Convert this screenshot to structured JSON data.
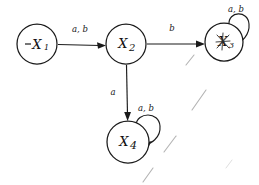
{
  "diagram": {
    "kind": "state-transition-diagram",
    "alphabet": [
      "a",
      "b"
    ],
    "ink_color": "#1a1a1a",
    "background_color": "#ffffff"
  },
  "states": [
    {
      "id": "x1",
      "label": "X",
      "subscript": "1",
      "initial_marker": "–",
      "is_initial": true,
      "cx": 37,
      "cy": 44,
      "r": 20
    },
    {
      "id": "x2",
      "label": "X",
      "subscript": "2",
      "is_initial": false,
      "cx": 126,
      "cy": 44,
      "r": 20
    },
    {
      "id": "x3",
      "label": "X",
      "subscript": "3",
      "overwritten": true,
      "is_initial": false,
      "cx": 224,
      "cy": 42,
      "r": 19
    },
    {
      "id": "x4",
      "label": "X",
      "subscript": "4",
      "is_initial": false,
      "cx": 128,
      "cy": 142,
      "r": 21
    }
  ],
  "transitions": [
    {
      "from": "x1",
      "to": "x2",
      "label": "a, b",
      "label_x": 80,
      "label_y": 29
    },
    {
      "from": "x2",
      "to": "x3",
      "label": "b",
      "label_x": 172,
      "label_y": 28
    },
    {
      "from": "x2",
      "to": "x4",
      "label": "a",
      "label_x": 113,
      "label_y": 92
    }
  ],
  "self_loops": [
    {
      "state": "x3",
      "label": "a, b",
      "label_x": 236,
      "label_y": 9
    },
    {
      "state": "x4",
      "label": "a, b",
      "label_x": 146,
      "label_y": 108
    }
  ],
  "stray_marks": [
    {
      "x1": 186,
      "y1": 65,
      "x2": 194,
      "y2": 55,
      "faint": false
    },
    {
      "x1": 192,
      "y1": 110,
      "x2": 206,
      "y2": 90,
      "faint": false
    },
    {
      "x1": 164,
      "y1": 152,
      "x2": 176,
      "y2": 136,
      "faint": false
    },
    {
      "x1": 143,
      "y1": 182,
      "x2": 153,
      "y2": 168,
      "faint": false
    },
    {
      "x1": 226,
      "y1": 168,
      "x2": 232,
      "y2": 160,
      "faint": true
    }
  ]
}
